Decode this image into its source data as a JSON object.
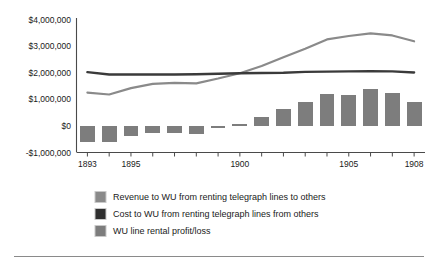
{
  "chart_data": {
    "type": "bar",
    "title": "",
    "subtitle": "",
    "xlabel": "",
    "ylabel": "",
    "x": [
      1893,
      1894,
      1895,
      1896,
      1897,
      1898,
      1899,
      1900,
      1901,
      1902,
      1903,
      1904,
      1905,
      1906,
      1907,
      1908
    ],
    "categories": [
      "1893",
      "1894",
      "1895",
      "1896",
      "1897",
      "1898",
      "1899",
      "1900",
      "1901",
      "1902",
      "1903",
      "1904",
      "1905",
      "1906",
      "1907",
      "1908"
    ],
    "xlim": [
      1892.5,
      1908.5
    ],
    "ylim": [
      -1000000,
      4000000
    ],
    "ytick_values": [
      4000000,
      3000000,
      2000000,
      1000000,
      0,
      -1000000
    ],
    "ytick_labels": [
      "$4,000,000",
      "$3,000,000",
      "$2,000,000",
      "$1,000,000",
      "$0",
      "-$1,000,000"
    ],
    "xtick_values": [
      1893,
      1894,
      1895,
      1896,
      1897,
      1898,
      1899,
      1900,
      1901,
      1902,
      1903,
      1904,
      1905,
      1906,
      1907,
      1908
    ],
    "xtick_labels_shown": [
      "1893",
      "1895",
      "1900",
      "1905",
      "1908"
    ],
    "grid": false,
    "legend_position": "bottom",
    "series": [
      {
        "name": "Revenue to WU from renting telegraph lines to others",
        "type": "line",
        "color": "#8a8a8a",
        "values": [
          1250000,
          1180000,
          1420000,
          1580000,
          1620000,
          1600000,
          1780000,
          1980000,
          2250000,
          2580000,
          2900000,
          3250000,
          3380000,
          3480000,
          3400000,
          3180000
        ]
      },
      {
        "name": "Cost to WU from renting telegraph lines from others",
        "type": "line",
        "color": "#3a3a3a",
        "values": [
          2020000,
          1930000,
          1930000,
          1930000,
          1930000,
          1940000,
          1960000,
          1980000,
          1990000,
          2000000,
          2030000,
          2040000,
          2050000,
          2060000,
          2050000,
          2010000
        ]
      },
      {
        "name": "WU line rental profit/loss",
        "type": "bar",
        "color": "#7d7d7d",
        "values": [
          -620000,
          -620000,
          -380000,
          -280000,
          -270000,
          -290000,
          -80000,
          80000,
          330000,
          640000,
          900000,
          1190000,
          1160000,
          1380000,
          1240000,
          900000
        ]
      }
    ]
  },
  "legend": {
    "items": [
      {
        "label": "Revenue to WU from renting telegraph lines to others",
        "color": "#8a8a8a"
      },
      {
        "label": "Cost to WU from renting telegraph lines from others",
        "color": "#2f2f2f"
      },
      {
        "label": "WU line rental profit/loss",
        "color": "#7d7d7d"
      }
    ]
  },
  "colors": {
    "revenue": "#8a8a8a",
    "cost": "#3a3a3a",
    "bars": "#7d7d7d",
    "axis": "#4a4a4a",
    "text": "#1a1a1a",
    "rule": "#8a8a8a",
    "background": "#ffffff"
  }
}
